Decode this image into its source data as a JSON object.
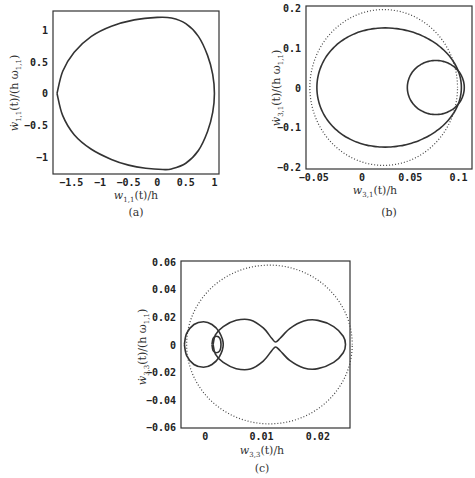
{
  "chart_data": [
    {
      "id": "a",
      "type": "line",
      "caption": "(a)",
      "xlabel": "w1,1(t)/h",
      "ylabel": "ẇ1,1(t)/(h ω1,1)",
      "xlim": [
        -1.82,
        1.08
      ],
      "ylim": [
        -1.27,
        1.3
      ],
      "xticks": [
        -1.5,
        -1,
        -0.5,
        0,
        0.5,
        1
      ],
      "xtick_labels": [
        "-1.5",
        "-1",
        "-0.5",
        "0",
        "0.5",
        "1"
      ],
      "yticks": [
        -1,
        -0.5,
        0,
        0.5,
        1
      ],
      "ytick_labels": [
        "-1",
        "-0.5",
        "0",
        "0.5",
        "1"
      ],
      "grid": false,
      "series": [
        {
          "name": "phase trajectory",
          "style": "solid",
          "points": [
            [
              -1.75,
              0
            ],
            [
              -1.65,
              0.35
            ],
            [
              -1.45,
              0.65
            ],
            [
              -1.15,
              0.9
            ],
            [
              -0.8,
              1.06
            ],
            [
              -0.4,
              1.16
            ],
            [
              0,
              1.2
            ],
            [
              0.25,
              1.19
            ],
            [
              0.5,
              1.1
            ],
            [
              0.72,
              0.9
            ],
            [
              0.88,
              0.6
            ],
            [
              0.97,
              0.3
            ],
            [
              1.0,
              0
            ],
            [
              0.97,
              -0.3
            ],
            [
              0.88,
              -0.6
            ],
            [
              0.72,
              -0.9
            ],
            [
              0.5,
              -1.1
            ],
            [
              0.25,
              -1.19
            ],
            [
              0.1,
              -1.2
            ],
            [
              -0.2,
              -1.18
            ],
            [
              -0.5,
              -1.13
            ],
            [
              -0.8,
              -1.04
            ],
            [
              -1.15,
              -0.88
            ],
            [
              -1.45,
              -0.65
            ],
            [
              -1.65,
              -0.35
            ],
            [
              -1.75,
              0
            ]
          ]
        }
      ]
    },
    {
      "id": "b",
      "type": "line",
      "caption": "(b)",
      "xlabel": "w3,1(t)/h",
      "ylabel": "ẇ3,1(t)/(h ω1,1)",
      "xlim": [
        -0.058,
        0.114
      ],
      "ylim": [
        -0.205,
        0.205
      ],
      "xticks": [
        -0.05,
        0,
        0.05,
        0.1
      ],
      "xtick_labels": [
        "-0.05",
        "0",
        "0.05",
        "0.1"
      ],
      "yticks": [
        -0.2,
        -0.1,
        0,
        0.1,
        0.2
      ],
      "ytick_labels": [
        "-0.2",
        "-0.1",
        "0",
        "0.1",
        "0.2"
      ],
      "grid": false,
      "series": [
        {
          "name": "outer loop",
          "style": "solid",
          "ellipse": {
            "cx": 0.024,
            "cy": 0,
            "rx": 0.079,
            "ry": 0.15,
            "skew": 0.35
          }
        },
        {
          "name": "inner loop",
          "style": "solid",
          "ellipse": {
            "cx": 0.0765,
            "cy": 0,
            "rx": 0.0295,
            "ry": 0.068,
            "skew": 0
          }
        },
        {
          "name": "reference circle",
          "style": "dotted",
          "ellipse": {
            "cx": 0.0225,
            "cy": 0,
            "rx": 0.0765,
            "ry": 0.196,
            "skew": 0
          }
        }
      ]
    },
    {
      "id": "c",
      "type": "line",
      "caption": "(c)",
      "xlabel": "w3,3(t)/h",
      "ylabel": "ẇ3,3(t)/(h ω1,1)",
      "xlim": [
        -0.0043,
        0.0257
      ],
      "ylim": [
        -0.0605,
        0.0605
      ],
      "xticks": [
        0,
        0.01,
        0.02
      ],
      "xtick_labels": [
        "0",
        "0.01",
        "0.02"
      ],
      "yticks": [
        -0.06,
        -0.04,
        -0.02,
        0,
        0.02,
        0.04,
        0.06
      ],
      "ytick_labels": [
        "-0.06",
        "-0.04",
        "-0.02",
        "0",
        "0.02",
        "0.04",
        "0.06"
      ],
      "grid": false,
      "series": [
        {
          "name": "left loop",
          "style": "solid",
          "points": [
            [
              -0.0037,
              0
            ],
            [
              -0.0033,
              0.008
            ],
            [
              -0.002,
              0.0145
            ],
            [
              -0.0003,
              0.0165
            ],
            [
              0.0012,
              0.0145
            ],
            [
              0.0025,
              0.009
            ],
            [
              0.0032,
              0
            ],
            [
              0.0025,
              -0.009
            ],
            [
              0.0012,
              -0.0145
            ],
            [
              -0.0003,
              -0.0165
            ],
            [
              -0.002,
              -0.0145
            ],
            [
              -0.0033,
              -0.008
            ],
            [
              -0.0037,
              0
            ]
          ]
        },
        {
          "name": "inner small loop",
          "style": "solid",
          "points": [
            [
              0.0012,
              0
            ],
            [
              0.0014,
              0.0045
            ],
            [
              0.002,
              0.006
            ],
            [
              0.0026,
              0.0045
            ],
            [
              0.0028,
              0
            ],
            [
              0.0026,
              -0.0045
            ],
            [
              0.002,
              -0.006
            ],
            [
              0.0014,
              -0.0045
            ],
            [
              0.0012,
              0
            ]
          ]
        },
        {
          "name": "double lobe",
          "style": "solid",
          "points": [
            [
              0.0014,
              0
            ],
            [
              0.0018,
              0.007
            ],
            [
              0.0032,
              0.013
            ],
            [
              0.0055,
              0.0175
            ],
            [
              0.008,
              0.0178
            ],
            [
              0.0103,
              0.012
            ],
            [
              0.0118,
              0.0045
            ],
            [
              0.0125,
              0.0018
            ],
            [
              0.0133,
              0.0045
            ],
            [
              0.015,
              0.0115
            ],
            [
              0.0175,
              0.017
            ],
            [
              0.02,
              0.0175
            ],
            [
              0.0228,
              0.013
            ],
            [
              0.0245,
              0.006
            ],
            [
              0.0249,
              0
            ],
            [
              0.0245,
              -0.006
            ],
            [
              0.0228,
              -0.013
            ],
            [
              0.02,
              -0.0175
            ],
            [
              0.0175,
              -0.017
            ],
            [
              0.015,
              -0.0115
            ],
            [
              0.0133,
              -0.0045
            ],
            [
              0.0125,
              -0.0018
            ],
            [
              0.0118,
              -0.0045
            ],
            [
              0.0103,
              -0.012
            ],
            [
              0.008,
              -0.0178
            ],
            [
              0.0055,
              -0.0175
            ],
            [
              0.0032,
              -0.013
            ],
            [
              0.0018,
              -0.007
            ],
            [
              0.0014,
              0
            ]
          ]
        },
        {
          "name": "reference circle",
          "style": "dotted",
          "ellipse": {
            "cx": 0.0114,
            "cy": 0,
            "rx": 0.0147,
            "ry": 0.0575,
            "skew": 0
          }
        }
      ]
    }
  ],
  "panels": {
    "a": {
      "caption": "(a)",
      "xlabel_main": "w",
      "xlabel_sub": "1,1",
      "xlabel_rest": "(t)/h",
      "ylabel_main": "ẇ",
      "ylabel_sub": "1,1",
      "ylabel_rest": "(t)/(h ω",
      "ylabel_sub2": "1,1",
      "ylabel_end": ")"
    },
    "b": {
      "caption": "(b)",
      "xlabel_main": "w",
      "xlabel_sub": "3,1",
      "xlabel_rest": "(t)/h",
      "ylabel_main": "ẇ",
      "ylabel_sub": "3,1",
      "ylabel_rest": "(t)/(h ω",
      "ylabel_sub2": "1,1",
      "ylabel_end": ")"
    },
    "c": {
      "caption": "(c)",
      "xlabel_main": "w",
      "xlabel_sub": "3,3",
      "xlabel_rest": "(t)/h",
      "ylabel_main": "ẇ",
      "ylabel_sub": "3,3",
      "ylabel_rest": "(t)/(h ω",
      "ylabel_sub2": "1,1",
      "ylabel_end": ")"
    }
  }
}
